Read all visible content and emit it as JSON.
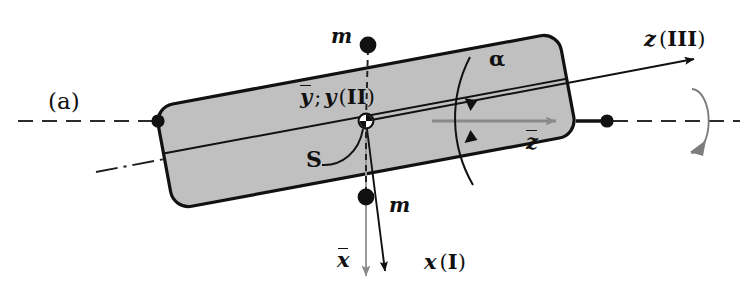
{
  "figure": {
    "caption_label": "(a)",
    "colors": {
      "plate_fill": "#c0c0c0",
      "plate_stroke": "#111111",
      "axis_line": "#2b2b2b",
      "gray_arrow": "#8a8a8a",
      "label_text": "#101010",
      "background": "#ffffff"
    }
  },
  "labels": {
    "caption": "(a)",
    "mass_top": "m",
    "mass_bottom": "m",
    "center_point": "S",
    "y_axes": {
      "bar_symbol": "y",
      "separator": ";",
      "body_symbol": "y",
      "frame_index": "II",
      "open_paren": "(",
      "close_paren": ")"
    },
    "z_body": {
      "symbol": "z",
      "frame_index": "III",
      "open_paren": "(",
      "close_paren": ")"
    },
    "z_bar": "z",
    "x_body": {
      "symbol": "x",
      "frame_index": "I",
      "open_paren": "(",
      "close_paren": ")"
    },
    "x_bar": "x",
    "angle": "α"
  },
  "geometry": {
    "plate": {
      "center": [
        366,
        121
      ],
      "half_length": 205,
      "half_width": 52,
      "tilt_degrees": -10.5,
      "corner_radius": 18
    },
    "shaft_axis": {
      "y": 121,
      "left_end": 18,
      "right_end": 740,
      "style": "dashed"
    },
    "bearings": [
      {
        "name": "left-bearing",
        "cx": 158,
        "cy": 121
      },
      {
        "name": "right-bearing",
        "cx": 607,
        "cy": 121
      }
    ],
    "masses": [
      {
        "name": "mass-top",
        "cx": 368,
        "cy": 45,
        "r": 8
      },
      {
        "name": "mass-bottom",
        "cx": 366,
        "cy": 197,
        "r": 8
      }
    ],
    "center_marker": {
      "cx": 366,
      "cy": 121,
      "r": 7
    },
    "z_body_axis": {
      "from": [
        366,
        121
      ],
      "to": [
        694,
        60
      ]
    },
    "x_body_axis": {
      "from": [
        366,
        121
      ],
      "to": [
        384,
        272
      ]
    },
    "x_bar_axis": {
      "from": [
        366,
        121
      ],
      "to": [
        366,
        277
      ]
    },
    "z_bar_arrow": {
      "from": [
        455,
        121
      ],
      "to": [
        555,
        121
      ]
    },
    "angle_arc": {
      "center": [
        366,
        121
      ],
      "radius": 131
    },
    "rotation_ellipse": {
      "cx": 692,
      "cy": 121,
      "rx": 17,
      "ry": 32
    }
  }
}
